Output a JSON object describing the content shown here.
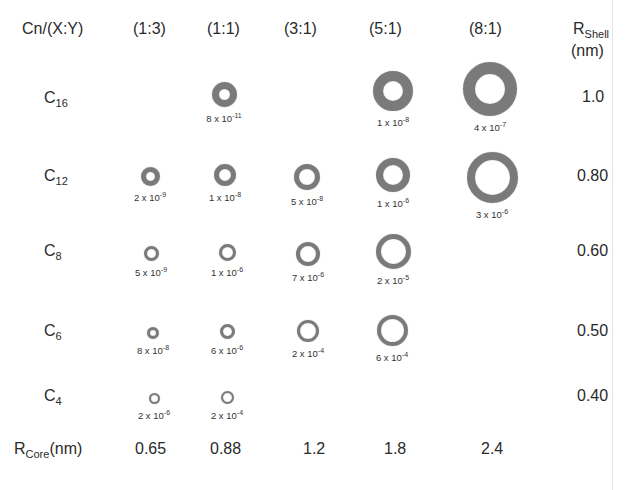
{
  "header": {
    "corner_label": "Cn/(X:Y)",
    "ratios": [
      "(1:3)",
      "(1:1)",
      "(3:1)",
      "(5:1)",
      "(8:1)"
    ],
    "shell_label_main": "R",
    "shell_label_sub": "Shell",
    "shell_label_unit": "(nm)"
  },
  "rows": [
    {
      "label_main": "C",
      "label_sub": "16",
      "r_shell": "1.0"
    },
    {
      "label_main": "C",
      "label_sub": "12",
      "r_shell": "0.80"
    },
    {
      "label_main": "C",
      "label_sub": "8",
      "r_shell": "0.60"
    },
    {
      "label_main": "C",
      "label_sub": "6",
      "r_shell": "0.50"
    },
    {
      "label_main": "C",
      "label_sub": "4",
      "r_shell": "0.40"
    }
  ],
  "footer": {
    "core_label_main": "R",
    "core_label_sub": "Core",
    "core_label_unit": "(nm)",
    "r_core": [
      "0.65",
      "0.88",
      "1.2",
      "1.8",
      "2.4"
    ]
  },
  "cells": [
    {
      "row": "C16",
      "ratio": "(1:1)",
      "mant": "8 x 10",
      "exp": "-11",
      "cx": 224,
      "cy": 94,
      "d": 25,
      "t": 7
    },
    {
      "row": "C16",
      "ratio": "(5:1)",
      "mant": "1 x 10",
      "exp": "-8",
      "cx": 393,
      "cy": 91,
      "d": 40,
      "t": 10
    },
    {
      "row": "C16",
      "ratio": "(8:1)",
      "mant": "4 x 10",
      "exp": "-7",
      "cx": 490,
      "cy": 89,
      "d": 54,
      "t": 12
    },
    {
      "row": "C12",
      "ratio": "(1:3)",
      "mant": "2 x 10",
      "exp": "-9",
      "cx": 150,
      "cy": 176,
      "d": 19,
      "t": 5
    },
    {
      "row": "C12",
      "ratio": "(1:1)",
      "mant": "1 x 10",
      "exp": "-8",
      "cx": 225,
      "cy": 175,
      "d": 22,
      "t": 5
    },
    {
      "row": "C12",
      "ratio": "(3:1)",
      "mant": "5 x 10",
      "exp": "-8",
      "cx": 307,
      "cy": 177,
      "d": 26,
      "t": 5
    },
    {
      "row": "C12",
      "ratio": "(5:1)",
      "mant": "1 x 10",
      "exp": "-6",
      "cx": 393,
      "cy": 175,
      "d": 34,
      "t": 7
    },
    {
      "row": "C12",
      "ratio": "(8:1)",
      "mant": "3 x 10",
      "exp": "-6",
      "cx": 492,
      "cy": 177,
      "d": 51,
      "t": 8
    },
    {
      "row": "C8",
      "ratio": "(1:3)",
      "mant": "5 x 10",
      "exp": "-9",
      "cx": 151,
      "cy": 253,
      "d": 15,
      "t": 3
    },
    {
      "row": "C8",
      "ratio": "(1:1)",
      "mant": "1 x 10",
      "exp": "-6",
      "cx": 227,
      "cy": 252,
      "d": 17,
      "t": 3
    },
    {
      "row": "C8",
      "ratio": "(3:1)",
      "mant": "7 x 10",
      "exp": "-6",
      "cx": 308,
      "cy": 254,
      "d": 24,
      "t": 4
    },
    {
      "row": "C8",
      "ratio": "(5:1)",
      "mant": "2 x 10",
      "exp": "-5",
      "cx": 393,
      "cy": 251,
      "d": 35,
      "t": 5
    },
    {
      "row": "C6",
      "ratio": "(1:3)",
      "mant": "8 x 10",
      "exp": "-8",
      "cx": 153,
      "cy": 333,
      "d": 12,
      "t": 3
    },
    {
      "row": "C6",
      "ratio": "(1:1)",
      "mant": "6 x 10",
      "exp": "-6",
      "cx": 227,
      "cy": 331,
      "d": 15,
      "t": 3
    },
    {
      "row": "C6",
      "ratio": "(3:1)",
      "mant": "2 x 10",
      "exp": "-4",
      "cx": 308,
      "cy": 331,
      "d": 22,
      "t": 3
    },
    {
      "row": "C6",
      "ratio": "(5:1)",
      "mant": "6 x 10",
      "exp": "-4",
      "cx": 392,
      "cy": 330,
      "d": 31,
      "t": 4
    },
    {
      "row": "C4",
      "ratio": "(1:3)",
      "mant": "2 x 10",
      "exp": "-6",
      "cx": 154,
      "cy": 398,
      "d": 11,
      "t": 2
    },
    {
      "row": "C4",
      "ratio": "(1:1)",
      "mant": "2 x 10",
      "exp": "-4",
      "cx": 227,
      "cy": 397,
      "d": 13,
      "t": 2
    }
  ]
}
